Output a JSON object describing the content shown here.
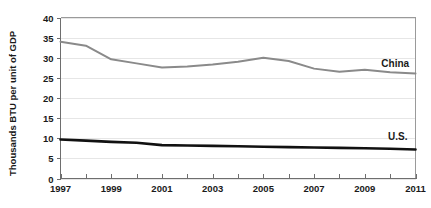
{
  "chart_data": {
    "type": "line",
    "title": "",
    "subtitle": "",
    "xlabel": "",
    "ylabel": "Thousands BTU per unit of GDP",
    "x": [
      1997,
      1998,
      1999,
      2000,
      2001,
      2002,
      2003,
      2004,
      2005,
      2006,
      2007,
      2008,
      2009,
      2010,
      2011
    ],
    "xlim": [
      1997,
      2011
    ],
    "ylim": [
      0,
      40
    ],
    "y_ticks": [
      0,
      5,
      10,
      15,
      20,
      25,
      30,
      35,
      40
    ],
    "y_tick_labels": [
      "0",
      "5",
      "10",
      "15",
      "20",
      "25",
      "30",
      "35",
      "40"
    ],
    "x_ticks": [
      1997,
      1998,
      1999,
      2000,
      2001,
      2002,
      2003,
      2004,
      2005,
      2006,
      2007,
      2008,
      2009,
      2010,
      2011
    ],
    "x_tick_labels_shown": [
      "1997",
      "1999",
      "2001",
      "2003",
      "2005",
      "2007",
      "2009",
      "2011"
    ],
    "x_labeled_years": [
      1997,
      1999,
      2001,
      2003,
      2005,
      2007,
      2009,
      2011
    ],
    "grid": true,
    "grid_axis": "y",
    "legend": "inline-labels",
    "legend_position": "right-inline",
    "series": [
      {
        "name": "China",
        "color": "#8a8a8a",
        "stroke_width": 2.0,
        "label_x": 2010.2,
        "label_y": 28.6,
        "values": [
          34.0,
          33.0,
          29.6,
          28.6,
          27.6,
          27.8,
          28.3,
          29.0,
          30.0,
          29.2,
          27.3,
          26.5,
          27.0,
          26.4,
          26.1
        ]
      },
      {
        "name": "U.S.",
        "color": "#111111",
        "stroke_width": 2.6,
        "label_x": 2010.3,
        "label_y": 10.4,
        "values": [
          9.7,
          9.4,
          9.1,
          8.9,
          8.3,
          8.2,
          8.1,
          8.0,
          7.9,
          7.8,
          7.7,
          7.6,
          7.5,
          7.4,
          7.2
        ]
      }
    ]
  },
  "axis": {
    "y_title": "Thousands BTU per unit of GDP"
  },
  "colors": {
    "background": "#ffffff",
    "gridline": "#e6e6e6",
    "axis": "#6e6e6e",
    "frame": "#9a9a9a",
    "text": "#1a1a1a",
    "china_line": "#8a8a8a",
    "us_line": "#111111"
  }
}
